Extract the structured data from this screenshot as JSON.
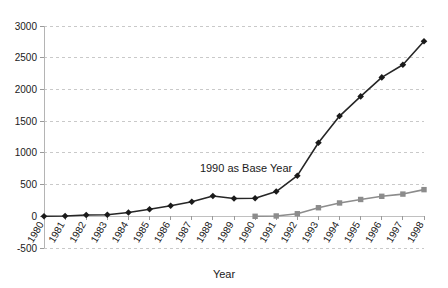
{
  "chart_data": {
    "type": "line",
    "title": "",
    "xlabel": "Year",
    "ylabel": "",
    "ylim": [
      -500,
      3000
    ],
    "ytick_step": 500,
    "grid": true,
    "legend": "none",
    "categories": [
      "1980",
      "1981",
      "1982",
      "1983",
      "1984",
      "1985",
      "1986",
      "1987",
      "1988",
      "1989",
      "1990",
      "1991",
      "1992",
      "1993",
      "1994",
      "1995",
      "1996",
      "1997",
      "1998"
    ],
    "ytick_labels": [
      "3000",
      "2500",
      "2000",
      "1500",
      "1000",
      "500",
      "0",
      "-500"
    ],
    "ytick_values": [
      3000,
      2500,
      2000,
      1500,
      1000,
      500,
      0,
      -500
    ],
    "series": [
      {
        "name": "series-diamond",
        "marker": "diamond",
        "color": "#1a1a1a",
        "x": [
          "1980",
          "1981",
          "1982",
          "1983",
          "1984",
          "1985",
          "1986",
          "1987",
          "1988",
          "1989",
          "1990",
          "1991",
          "1992",
          "1993",
          "1994",
          "1995",
          "1996",
          "1997",
          "1998"
        ],
        "values": [
          0,
          5,
          20,
          25,
          60,
          110,
          165,
          230,
          320,
          280,
          285,
          390,
          640,
          1160,
          1580,
          1890,
          2190,
          2390,
          2760
        ]
      },
      {
        "name": "series-square",
        "marker": "square",
        "color": "#8c8c8c",
        "x": [
          "1990",
          "1991",
          "1992",
          "1993",
          "1994",
          "1995",
          "1996",
          "1997",
          "1998"
        ],
        "values": [
          0,
          5,
          40,
          135,
          210,
          265,
          315,
          350,
          420
        ]
      }
    ],
    "annotations": [
      {
        "text": "1990 as Base Year",
        "x": "1988",
        "y": 700
      }
    ]
  },
  "axis": {
    "x_title": "Year"
  },
  "annotation": {
    "base_year_note": "1990 as Base Year"
  },
  "colors": {
    "series_a": "#1a1a1a",
    "series_b": "#8c8c8c",
    "grid": "#c9c9c9",
    "axis": "#b4b4b4",
    "text": "#1a1a1a",
    "background": "#ffffff"
  }
}
